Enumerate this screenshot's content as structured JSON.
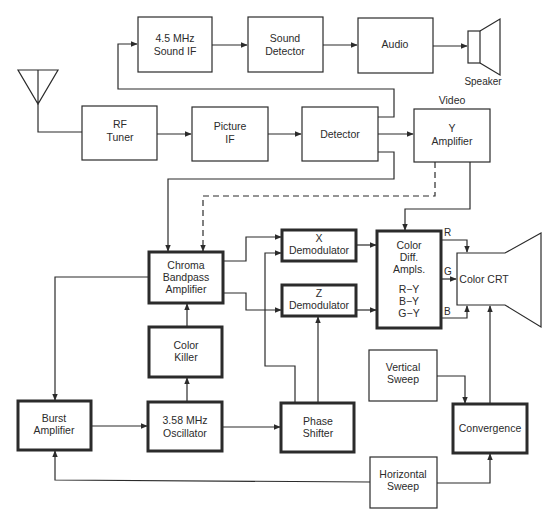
{
  "diagram": {
    "colors": {
      "line": "#2b2b2b",
      "background": "#ffffff"
    },
    "blocks": {
      "sound_if": {
        "lines": [
          "4.5 MHz",
          "Sound IF"
        ]
      },
      "sound_detector": {
        "lines": [
          "Sound",
          "Detector"
        ]
      },
      "audio": {
        "lines": [
          "Audio"
        ]
      },
      "rf_tuner": {
        "lines": [
          "RF",
          "Tuner"
        ]
      },
      "picture_if": {
        "lines": [
          "Picture",
          "IF"
        ]
      },
      "detector": {
        "lines": [
          "Detector"
        ]
      },
      "y_amplifier": {
        "lines": [
          "Y",
          "Amplifier"
        ]
      },
      "chroma_bandpass": {
        "lines": [
          "Chroma",
          "Bandpass",
          "Amplifier"
        ]
      },
      "x_demodulator": {
        "lines": [
          "X",
          "Demodulator"
        ]
      },
      "z_demodulator": {
        "lines": [
          "Z",
          "Demodulator"
        ]
      },
      "color_diff": {
        "lines": [
          "Color",
          "Diff.",
          "Ampls.",
          "R−Y",
          "B−Y",
          "G−Y"
        ]
      },
      "color_crt": {
        "lines": [
          "Color CRT"
        ]
      },
      "color_killer": {
        "lines": [
          "Color",
          "Killer"
        ]
      },
      "burst_amplifier": {
        "lines": [
          "Burst",
          "Amplifier"
        ]
      },
      "oscillator": {
        "lines": [
          "3.58 MHz",
          "Oscillator"
        ]
      },
      "phase_shifter": {
        "lines": [
          "Phase",
          "Shifter"
        ]
      },
      "vertical_sweep": {
        "lines": [
          "Vertical",
          "Sweep"
        ]
      },
      "convergence": {
        "lines": [
          "Convergence"
        ]
      },
      "horizontal_sweep": {
        "lines": [
          "Horizontal",
          "Sweep"
        ]
      }
    },
    "labels": {
      "speaker": "Speaker",
      "video": "Video",
      "r": "R",
      "g": "G",
      "b": "B"
    },
    "icons": {
      "antenna": "antenna-icon",
      "speaker": "speaker-icon",
      "crt": "crt-tube-icon"
    }
  }
}
